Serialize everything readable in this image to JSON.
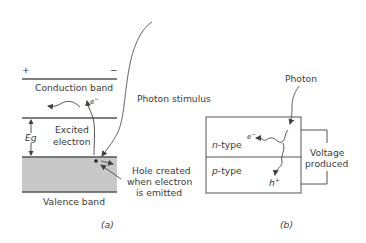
{
  "panel_a": {
    "caption": "(a)",
    "plus_sign": "+",
    "minus_sign": "−",
    "conduction_band": "Conduction band",
    "valence_band": "Valence band",
    "gap_label": "Eg",
    "excited_line1": "Excited",
    "excited_line2": "electron",
    "electron_label": "e",
    "electron_sup": "−",
    "stimulus_label": "Photon stimulus",
    "hole_line1": "Hole created",
    "hole_line2": "when electron",
    "hole_line3": "is emitted",
    "colors": {
      "band_fill": "#c8c8c8",
      "line": "#555555"
    }
  },
  "panel_b": {
    "caption": "(b)",
    "photon_label": "Photon",
    "n_type_italic": "n",
    "n_type_rest": "-type",
    "p_type_italic": "p",
    "p_type_rest": "-type",
    "electron_label": "e",
    "electron_sup": "−",
    "hole_label": "h",
    "hole_sup": "+",
    "voltage_line1": "Voltage",
    "voltage_line2": "produced"
  }
}
